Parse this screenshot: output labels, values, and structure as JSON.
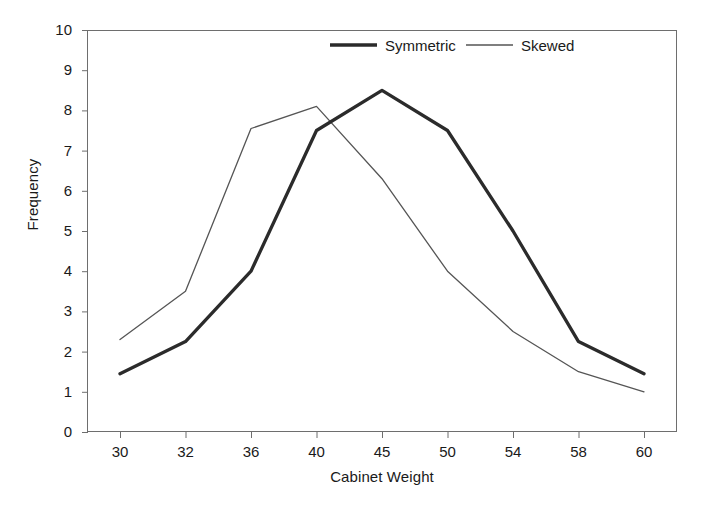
{
  "chart_data": {
    "type": "line",
    "title": "",
    "xlabel": "Cabinet Weight",
    "ylabel": "Frequency",
    "categories": [
      "30",
      "32",
      "36",
      "40",
      "45",
      "50",
      "54",
      "58",
      "60"
    ],
    "ylim": [
      0,
      10
    ],
    "yticks": [
      "0",
      "1",
      "2",
      "3",
      "4",
      "5",
      "6",
      "7",
      "8",
      "9",
      "10"
    ],
    "grid": false,
    "legend_position": "top-right-inside",
    "series": [
      {
        "name": "Symmetric",
        "style": "thick-solid",
        "color": "#2b2b2b",
        "values": [
          1.45,
          2.25,
          4.0,
          7.5,
          8.5,
          7.5,
          5.0,
          2.25,
          1.45
        ]
      },
      {
        "name": "Skewed",
        "style": "thin-solid",
        "color": "#555555",
        "values": [
          2.3,
          3.5,
          7.55,
          8.1,
          6.3,
          4.0,
          2.5,
          1.5,
          1.0
        ]
      }
    ]
  },
  "legend": {
    "items": [
      {
        "label": "Symmetric"
      },
      {
        "label": "Skewed"
      }
    ]
  }
}
